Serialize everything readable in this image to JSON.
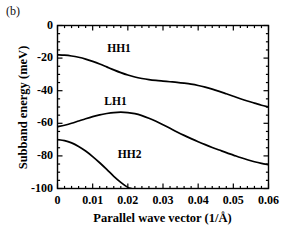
{
  "panel": {
    "label": "(b)"
  },
  "chart_data": {
    "type": "line",
    "title": "",
    "subtitle": "",
    "panel_label": "(b)",
    "xlabel": "Parallel  wave  vector  (1/Å)",
    "ylabel": "Subband  energy  (meV)",
    "xlim": [
      0,
      0.06
    ],
    "ylim": [
      -100,
      0
    ],
    "xticks": [
      0,
      0.01,
      0.02,
      0.03,
      0.04,
      0.05,
      0.06
    ],
    "xticklabels": [
      "0",
      "0.01",
      "0.02",
      "0.03",
      "0.04",
      "0.05",
      "0.06"
    ],
    "yticks": [
      0,
      -20,
      -40,
      -60,
      -80,
      -100
    ],
    "yticklabels": [
      "0",
      "-20",
      "-40",
      "-60",
      "-80",
      "-100"
    ],
    "x_minor_ticks_per_major": 5,
    "y_minor_ticks_per_major": 4,
    "grid": false,
    "legend": "inline-annotations",
    "legend_position": "none",
    "line_color": "#000000",
    "frame_color": "#000000",
    "background": "#ffffff",
    "series": [
      {
        "name": "HH1",
        "label": "HH1",
        "label_x": 0.0175,
        "label_y": -14.5,
        "x": [
          0.0,
          0.002,
          0.004,
          0.006,
          0.008,
          0.01,
          0.012,
          0.014,
          0.016,
          0.018,
          0.02,
          0.022,
          0.024,
          0.026,
          0.028,
          0.03,
          0.032,
          0.034,
          0.036,
          0.038,
          0.04,
          0.042,
          0.044,
          0.046,
          0.048,
          0.05,
          0.052,
          0.054,
          0.056,
          0.058,
          0.06
        ],
        "y": [
          -18.0,
          -18.2,
          -18.7,
          -19.5,
          -20.6,
          -22.0,
          -23.6,
          -25.4,
          -27.2,
          -28.9,
          -30.4,
          -31.6,
          -32.5,
          -33.2,
          -33.7,
          -34.1,
          -34.5,
          -34.9,
          -35.4,
          -36.0,
          -36.8,
          -37.8,
          -39.0,
          -40.4,
          -41.9,
          -43.4,
          -44.9,
          -46.3,
          -47.6,
          -48.9,
          -50.0
        ]
      },
      {
        "name": "LH1",
        "label": "LH1",
        "label_x": 0.0165,
        "label_y": -47.0,
        "x": [
          0.0,
          0.002,
          0.004,
          0.006,
          0.008,
          0.01,
          0.012,
          0.014,
          0.016,
          0.018,
          0.02,
          0.022,
          0.024,
          0.026,
          0.028,
          0.03,
          0.032,
          0.034,
          0.036,
          0.038,
          0.04,
          0.042,
          0.044,
          0.046,
          0.048,
          0.05,
          0.052,
          0.054,
          0.056,
          0.058,
          0.06
        ],
        "y": [
          -62.0,
          -61.2,
          -60.0,
          -58.6,
          -57.2,
          -55.9,
          -54.8,
          -54.0,
          -53.4,
          -53.2,
          -53.4,
          -54.1,
          -55.3,
          -56.9,
          -58.8,
          -60.9,
          -63.1,
          -65.3,
          -67.4,
          -69.4,
          -71.3,
          -73.1,
          -74.8,
          -76.4,
          -78.0,
          -79.5,
          -81.0,
          -82.4,
          -83.6,
          -84.6,
          -85.4
        ]
      },
      {
        "name": "HH2",
        "label": "HH2",
        "label_x": 0.0205,
        "label_y": -79.5,
        "x": [
          0.0,
          0.002,
          0.004,
          0.006,
          0.008,
          0.01,
          0.012,
          0.014,
          0.016,
          0.018,
          0.02,
          0.021
        ],
        "y": [
          -70.0,
          -70.6,
          -72.0,
          -74.2,
          -77.0,
          -80.4,
          -84.2,
          -88.3,
          -92.5,
          -96.2,
          -99.3,
          -100.0
        ],
        "clipped_at_bottom": true
      }
    ]
  }
}
